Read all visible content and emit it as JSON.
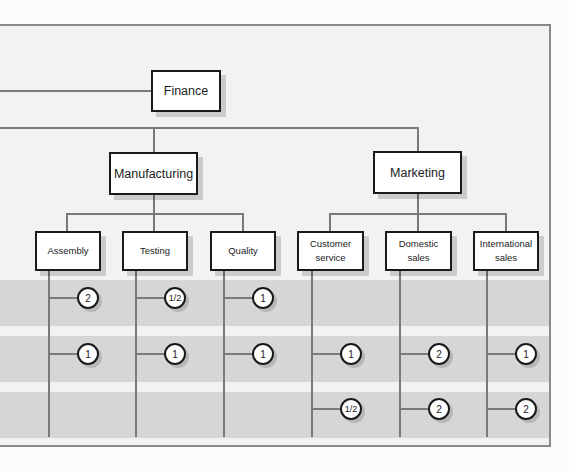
{
  "diagram": {
    "type": "organization-chart",
    "colors": {
      "background": "#f2f2f2",
      "band": "#d6d6d6",
      "line": "#7a7a7a",
      "box_border": "#1a1a1a",
      "box_fill": "#ffffff"
    },
    "top": {
      "label": "Finance"
    },
    "divisions": [
      {
        "label": "Manufacturing"
      },
      {
        "label": "Marketing"
      }
    ],
    "departments": [
      {
        "label": "Assembly",
        "division": "Manufacturing",
        "counts": [
          "2",
          "1",
          ""
        ]
      },
      {
        "label": "Testing",
        "division": "Manufacturing",
        "counts": [
          "1/2",
          "1",
          ""
        ]
      },
      {
        "label": "Quality",
        "division": "Manufacturing",
        "counts": [
          "1",
          "1",
          ""
        ]
      },
      {
        "label": "Customer service",
        "line1": "Customer",
        "line2": "service",
        "division": "Marketing",
        "counts": [
          "",
          "1",
          "1/2"
        ]
      },
      {
        "label": "Domestic sales",
        "line1": "Domestic",
        "line2": "sales",
        "division": "Marketing",
        "counts": [
          "",
          "2",
          "2"
        ]
      },
      {
        "label": "International sales",
        "line1": "International",
        "line2": "sales",
        "division": "Marketing",
        "counts": [
          "",
          "1",
          "2"
        ]
      }
    ],
    "rows": 3
  }
}
